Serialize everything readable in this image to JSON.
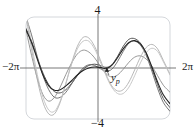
{
  "figure": {
    "title": "",
    "frame": {
      "color": "#c9cdd2",
      "corner_radius": 8
    }
  },
  "labels": {
    "y_max": "4",
    "y_min": "−4",
    "x_min": "−2π",
    "x_max": "2π",
    "particular_solution": "y",
    "particular_solution_sub": "p"
  },
  "chart_data": {
    "type": "line",
    "title": "",
    "xlabel": "",
    "ylabel": "",
    "xlim": [
      -6.283185,
      6.283185
    ],
    "ylim": [
      -4,
      4
    ],
    "xticks": [
      -6.283185,
      6.283185
    ],
    "xticklabels": [
      "−2π",
      "2π"
    ],
    "yticks": [
      -4,
      4
    ],
    "yticklabels": [
      "−4",
      "4"
    ],
    "grid": false,
    "legend": null,
    "annotations": [
      {
        "text": "y_p",
        "label": "y",
        "subscript": "p",
        "x": 0.95,
        "y": -0.55,
        "points_to_x": 0.78,
        "points_to_y": 0.12,
        "arrow": true
      }
    ],
    "series": [
      {
        "name": "particular-solution-yp",
        "color": "#222222",
        "width": 1.1,
        "x": [
          -6.283185,
          -5.8,
          -5.3,
          -4.8,
          -4.3,
          -3.8,
          -3.3,
          -2.8,
          -2.3,
          -1.8,
          -1.3,
          -0.8,
          -0.3,
          0.2,
          0.7,
          1.2,
          1.7,
          2.2,
          2.7,
          3.2,
          3.7,
          4.2,
          4.7,
          5.2,
          5.7,
          6.283185
        ],
        "y": [
          3.0,
          2.0,
          0.7,
          -0.55,
          -1.4,
          -1.75,
          -1.7,
          -1.4,
          -1.0,
          -0.55,
          -0.2,
          0.0,
          0.08,
          0.05,
          -0.05,
          0.2,
          0.8,
          1.5,
          2.0,
          2.15,
          1.9,
          1.2,
          0.1,
          -1.1,
          -2.1,
          -2.8
        ]
      },
      {
        "name": "general-solution-curve-1",
        "color": "#444444",
        "width": 0.9,
        "x": [
          -6.283185,
          -5.8,
          -5.3,
          -4.8,
          -4.3,
          -3.8,
          -3.3,
          -2.8,
          -2.3,
          -1.8,
          -1.3,
          -0.8,
          -0.3,
          0.2,
          0.7,
          1.2,
          1.7,
          2.2,
          2.7,
          3.2,
          3.7,
          4.2,
          4.7,
          5.2,
          5.7,
          6.283185
        ],
        "y": [
          3.1,
          2.1,
          0.8,
          -0.4,
          -1.3,
          -1.85,
          -1.95,
          -1.7,
          -1.2,
          -0.6,
          -0.1,
          0.2,
          0.3,
          0.2,
          0.05,
          0.25,
          0.9,
          1.7,
          2.25,
          2.3,
          1.95,
          1.15,
          -0.05,
          -1.3,
          -2.4,
          -3.1
        ]
      },
      {
        "name": "general-solution-curve-2",
        "color": "#666666",
        "width": 0.9,
        "x": [
          -6.283185,
          -5.8,
          -5.3,
          -4.8,
          -4.3,
          -3.8,
          -3.3,
          -2.8,
          -2.3,
          -1.8,
          -1.3,
          -0.8,
          -0.3,
          0.2,
          0.7,
          1.2,
          1.7,
          2.2,
          2.7,
          3.2,
          3.7,
          4.2,
          4.7,
          5.2,
          5.7,
          6.283185
        ],
        "y": [
          4.0,
          2.6,
          0.9,
          -0.6,
          -1.7,
          -2.3,
          -2.3,
          -1.9,
          -1.25,
          -0.55,
          0.0,
          0.25,
          0.2,
          -0.05,
          -0.25,
          -0.1,
          0.5,
          1.3,
          1.95,
          2.1,
          1.8,
          1.0,
          -0.25,
          -1.6,
          -2.7,
          -3.4
        ]
      },
      {
        "name": "general-solution-curve-3",
        "color": "#8d8d8d",
        "width": 0.9,
        "x": [
          -6.283185,
          -5.8,
          -5.3,
          -4.8,
          -4.3,
          -3.8,
          -3.3,
          -2.8,
          -2.3,
          -1.8,
          -1.3,
          -0.8,
          -0.3,
          0.2,
          0.7,
          1.2,
          1.7,
          2.2,
          2.7,
          3.2,
          3.7,
          4.2,
          4.7,
          5.2,
          5.7,
          6.283185
        ],
        "y": [
          3.0,
          1.0,
          -0.8,
          -2.1,
          -2.6,
          -2.3,
          -1.5,
          -0.5,
          0.4,
          1.1,
          1.4,
          1.25,
          0.8,
          0.15,
          -0.45,
          -0.7,
          -0.55,
          -0.1,
          0.45,
          0.85,
          0.95,
          0.7,
          0.15,
          -0.6,
          -1.35,
          -1.9
        ]
      },
      {
        "name": "general-solution-curve-4",
        "color": "#b0b0b0",
        "width": 0.9,
        "x": [
          -6.283185,
          -5.8,
          -5.3,
          -4.8,
          -4.3,
          -3.8,
          -3.3,
          -2.8,
          -2.3,
          -1.8,
          -1.3,
          -0.8,
          -0.3,
          0.2,
          0.7,
          1.2,
          1.7,
          2.2,
          2.7,
          3.2,
          3.7,
          4.2,
          4.7,
          5.2,
          5.7,
          6.283185
        ],
        "y": [
          4.0,
          1.5,
          -0.9,
          -2.7,
          -3.6,
          -3.6,
          -2.7,
          -1.2,
          0.4,
          1.7,
          2.4,
          2.35,
          1.7,
          0.65,
          -0.5,
          -1.4,
          -1.8,
          -1.7,
          -1.1,
          -0.15,
          0.85,
          1.6,
          1.85,
          1.5,
          0.6,
          -0.5
        ]
      },
      {
        "name": "general-solution-curve-5",
        "color": "#c2c2c2",
        "width": 0.9,
        "x": [
          -6.283185,
          -5.8,
          -5.3,
          -4.8,
          -4.3,
          -3.8,
          -3.3,
          -2.8,
          -2.3,
          -1.8,
          -1.3,
          -0.8,
          -0.3,
          0.2,
          0.7,
          1.2,
          1.7,
          2.2,
          2.7,
          3.2,
          3.7,
          4.2,
          4.7,
          5.2,
          5.7,
          6.283185
        ],
        "y": [
          4.4,
          1.9,
          -0.5,
          -2.3,
          -3.3,
          -3.4,
          -2.6,
          -1.2,
          0.3,
          1.5,
          2.1,
          2.1,
          1.5,
          0.5,
          -0.6,
          -1.5,
          -2.0,
          -2.0,
          -1.5,
          -0.6,
          0.4,
          1.2,
          1.55,
          1.3,
          0.5,
          -0.55
        ]
      }
    ]
  }
}
